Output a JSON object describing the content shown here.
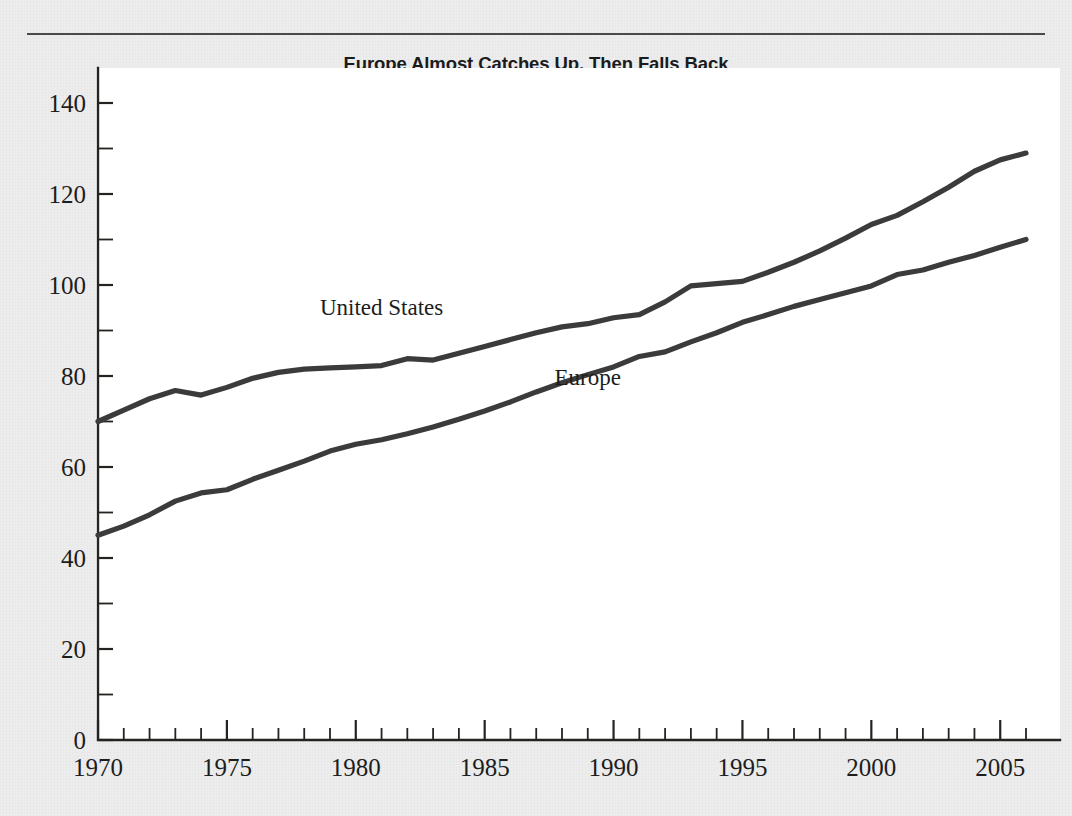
{
  "figure": {
    "title": "Europe Almost Catches Up, Then Falls Back",
    "plot_background": "#ffffff",
    "page_background": "#ededee",
    "rule_color": "#4a4a4c"
  },
  "chart_data": {
    "type": "line",
    "title": "Europe Almost Catches Up, Then Falls Back",
    "xlabel": "",
    "ylabel": "",
    "xlim": [
      1970,
      2006
    ],
    "ylim": [
      0,
      140
    ],
    "grid": false,
    "legend_position": "inline-labels",
    "x_ticks_major": [
      1970,
      1975,
      1980,
      1985,
      1990,
      1995,
      2000,
      2005
    ],
    "x_tick_labels": [
      "1970",
      "1975",
      "1980",
      "1985",
      "1990",
      "1995",
      "2000",
      "2005"
    ],
    "x_tick_minor_step": 1,
    "y_ticks_major": [
      0,
      20,
      40,
      60,
      80,
      100,
      120,
      140
    ],
    "y_tick_labels": [
      "0",
      "20",
      "40",
      "60",
      "80",
      "100",
      "120",
      "140"
    ],
    "y_tick_minor_step": 10,
    "x": [
      1970,
      1971,
      1972,
      1973,
      1974,
      1975,
      1976,
      1977,
      1978,
      1979,
      1980,
      1981,
      1982,
      1983,
      1984,
      1985,
      1986,
      1987,
      1988,
      1989,
      1990,
      1991,
      1992,
      1993,
      1994,
      1995,
      1996,
      1997,
      1998,
      1999,
      2000,
      2001,
      2002,
      2003,
      2004,
      2005,
      2006
    ],
    "series": [
      {
        "name": "United States",
        "color": "#3b3b3b",
        "label_x": 1981.0,
        "label_y": 93.5,
        "values": [
          70,
          72.5,
          75,
          76.8,
          75.8,
          77.5,
          79.5,
          80.8,
          81.5,
          81.8,
          82,
          82.3,
          83.8,
          83.5,
          85,
          86.5,
          88,
          89.5,
          90.8,
          91.5,
          92.8,
          93.5,
          96.3,
          99.8,
          100.3,
          100.8,
          102.8,
          105,
          107.5,
          110.3,
          113.3,
          115.3,
          118.3,
          121.5,
          125,
          127.5,
          129
        ]
      },
      {
        "name": "Europe",
        "color": "#3b3b3b",
        "label_x": 1989.0,
        "label_y": 78.0,
        "values": [
          45,
          47,
          49.5,
          52.5,
          54.3,
          55,
          57.3,
          59.3,
          61.3,
          63.5,
          65,
          66,
          67.3,
          68.8,
          70.5,
          72.3,
          74.3,
          76.5,
          78.5,
          80.3,
          82,
          84.3,
          85.3,
          87.5,
          89.5,
          91.8,
          93.5,
          95.3,
          96.8,
          98.3,
          99.8,
          102.3,
          103.3,
          105,
          106.5,
          108.3,
          110
        ]
      }
    ]
  }
}
